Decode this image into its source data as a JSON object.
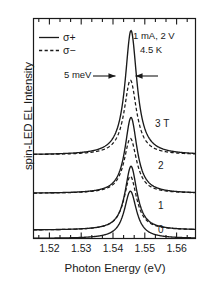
{
  "chart_data": {
    "type": "line",
    "title": "",
    "xlabel": "Photon Energy (eV)",
    "ylabel": "spin-LED EL Intensity",
    "xlim": [
      1.5145,
      1.5655
    ],
    "xticks": [
      "1.52",
      "1.53",
      "1.54",
      "1.55",
      "1.56"
    ],
    "xtick_values": [
      1.52,
      1.53,
      1.54,
      1.55,
      1.56
    ],
    "minor_ticks_per_interval": 2,
    "yticks": [],
    "grid": false,
    "legend": {
      "position": "top-left",
      "entries": [
        {
          "label": "σ+",
          "style": "solid"
        },
        {
          "label": "σ−",
          "style": "dashed"
        }
      ]
    },
    "annotations": [
      {
        "text": "1 mA, 2 V",
        "x": 1.5525,
        "y": 0.93
      },
      {
        "text": "4.5 K",
        "x": 1.5545,
        "y": 0.875
      },
      {
        "text": "5 meV",
        "x": 1.5375,
        "y": 0.735,
        "marker": "double-arrow-width"
      }
    ],
    "series": [
      {
        "name": "3 T",
        "label": "3 T",
        "baseline": 0.38,
        "sigma_plus": {
          "center": 1.5452,
          "height": 0.565,
          "fwhm": 0.0045,
          "style": "solid"
        },
        "sigma_minus": {
          "center": 1.545,
          "height": 0.34,
          "fwhm": 0.0047,
          "style": "dashed"
        }
      },
      {
        "name": "2 T",
        "label": "2",
        "baseline": 0.205,
        "sigma_plus": {
          "center": 1.5452,
          "height": 0.345,
          "fwhm": 0.0046,
          "style": "solid"
        },
        "sigma_minus": {
          "center": 1.545,
          "height": 0.25,
          "fwhm": 0.0048,
          "style": "dashed"
        }
      },
      {
        "name": "1 T",
        "label": "1",
        "baseline": 0.038,
        "sigma_plus": {
          "center": 1.5452,
          "height": 0.29,
          "fwhm": 0.0046,
          "style": "solid"
        },
        "sigma_minus": {
          "center": 1.545,
          "height": 0.245,
          "fwhm": 0.0048,
          "style": "dashed"
        }
      },
      {
        "name": "0 T",
        "label": "0",
        "baseline": 0.0,
        "sigma_plus": {
          "center": 1.545,
          "height": 0.215,
          "fwhm": 0.0047,
          "style": "solid"
        },
        "sigma_minus": {
          "center": 1.545,
          "height": 0.215,
          "fwhm": 0.0047,
          "style": "dashed"
        }
      }
    ]
  },
  "axis": {
    "xlabel": "Photon Energy (eV)",
    "ylabel": "spin-LED EL Intensity",
    "xticks": [
      "1.52",
      "1.53",
      "1.54",
      "1.55",
      "1.56"
    ]
  },
  "legend": {
    "sigma_plus": "σ+",
    "sigma_minus": "σ−"
  },
  "annotations": {
    "conditions_line1": "1 mA, 2 V",
    "conditions_line2": "4.5 K",
    "width_marker": "5 meV"
  },
  "curve_labels": {
    "t3": "3 T",
    "t2": "2",
    "t1": "1",
    "t0": "0"
  },
  "colors": {
    "line": "#1a1a1a",
    "background": "#ffffff"
  }
}
